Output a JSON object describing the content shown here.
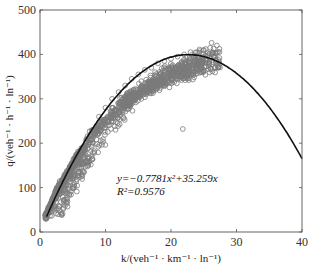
{
  "chart_data": {
    "type": "scatter",
    "title": "",
    "xlabel": "k/(veh⁻¹ · km⁻¹ · ln⁻¹)",
    "ylabel": "q/(veh⁻¹ · h⁻¹ · ln⁻¹)",
    "xlim": [
      0,
      40
    ],
    "ylim": [
      0,
      500
    ],
    "xticks": [
      0,
      10,
      20,
      30,
      40
    ],
    "yticks": [
      0,
      100,
      200,
      300,
      400,
      500
    ],
    "grid": false,
    "legend": null,
    "series": [
      {
        "name": "observed",
        "kind": "scatter",
        "marker": "open-circle",
        "color": "#7a7a7a",
        "description": "dense cloud of ~1500 points; rises from (1,30) to plateau ~380-420 at k≈20-27",
        "sample_points": [
          [
            1,
            30
          ],
          [
            1.5,
            50
          ],
          [
            2,
            60
          ],
          [
            2.5,
            80
          ],
          [
            3,
            90
          ],
          [
            3.5,
            105
          ],
          [
            4,
            120
          ],
          [
            5,
            150
          ],
          [
            6,
            180
          ],
          [
            7,
            200
          ],
          [
            8,
            230
          ],
          [
            9,
            260
          ],
          [
            10,
            280
          ],
          [
            11,
            300
          ],
          [
            12,
            315
          ],
          [
            13,
            330
          ],
          [
            14,
            345
          ],
          [
            15,
            355
          ],
          [
            16,
            365
          ],
          [
            17,
            370
          ],
          [
            18,
            380
          ],
          [
            19,
            385
          ],
          [
            20,
            390
          ],
          [
            21,
            395
          ],
          [
            22,
            400
          ],
          [
            23,
            405
          ],
          [
            24,
            405
          ],
          [
            25,
            410
          ],
          [
            26,
            415
          ],
          [
            27,
            420
          ],
          [
            21.8,
            232
          ]
        ]
      },
      {
        "name": "fit",
        "kind": "line",
        "color": "#111111",
        "equation": "y=-0.7781x²+35.259x",
        "coefficients": {
          "a": -0.7781,
          "b": 35.259,
          "c": 0
        },
        "x_range": [
          1,
          40
        ]
      }
    ],
    "annotations": [
      {
        "text": "y=−0.7781x²+35.259x",
        "x": 12,
        "y": 110
      },
      {
        "text": "R²=0.9576",
        "x": 12,
        "y": 85
      }
    ]
  },
  "labels": {
    "eq": "y=−0.7781x²+35.259x",
    "r2": "R²=0.9576",
    "xlabel": "k/(veh⁻¹ · km⁻¹ · ln⁻¹)",
    "ylabel": "q/(veh⁻¹ · h⁻¹ · ln⁻¹)"
  }
}
